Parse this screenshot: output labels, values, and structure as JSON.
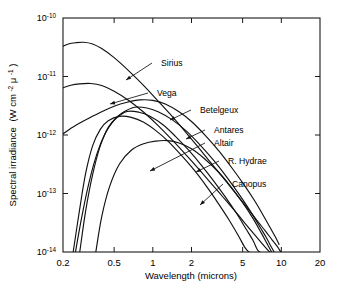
{
  "figure": {
    "background_color": "#ffffff",
    "line_color": "#111111"
  },
  "chart_data": {
    "type": "line",
    "title": "",
    "xlabel": "Wavelength (microns)",
    "ylabel": "Spectral irradiance (W cm⁻² μ⁻¹)",
    "ylabel_plain": "Spectral irradiance",
    "ylabel_units_parts": {
      "open": "(W cm",
      "exp1": "-2",
      "mu": " μ",
      "exp2": "-1",
      "close": ")"
    },
    "xscale": "log",
    "yscale": "log",
    "xlim": [
      0.2,
      20
    ],
    "ylim": [
      1e-14,
      1e-10
    ],
    "grid": false,
    "legend": "inline-annotations",
    "xticks": [
      0.2,
      0.5,
      1,
      2,
      5,
      10,
      20
    ],
    "xtick_labels": [
      "0.2",
      "0.5",
      "1",
      "2",
      "5",
      "10",
      "20"
    ],
    "yticks": [
      1e-14,
      1e-13,
      1e-12,
      1e-11,
      1e-10
    ],
    "ytick_labels_mantissa": [
      "10",
      "10",
      "10",
      "10",
      "10"
    ],
    "ytick_labels_exponent": [
      "-14",
      "-13",
      "-12",
      "-11",
      "-10"
    ],
    "series": [
      {
        "name": "Sirius",
        "peak_wavelength_microns": 0.29,
        "peak_irradiance": 3.8e-11,
        "points": [
          [
            0.2,
            3.3e-11
          ],
          [
            0.22,
            3.6e-11
          ],
          [
            0.25,
            3.78e-11
          ],
          [
            0.29,
            3.85e-11
          ],
          [
            0.34,
            3.6e-11
          ],
          [
            0.4,
            3e-11
          ],
          [
            0.5,
            2.1e-11
          ],
          [
            0.65,
            1.25e-11
          ],
          [
            0.85,
            7e-12
          ],
          [
            1.1,
            3.8e-12
          ],
          [
            1.5,
            1.8e-12
          ],
          [
            2.0,
            8.5e-13
          ],
          [
            2.7,
            3.8e-13
          ],
          [
            3.5,
            1.9e-13
          ],
          [
            4.5,
            9.5e-14
          ],
          [
            5.5,
            5.5e-14
          ],
          [
            6.5,
            3.4e-14
          ],
          [
            7.5,
            2.3e-14
          ],
          [
            8.5,
            1.6e-14
          ],
          [
            9.3,
            1.25e-14
          ],
          [
            9.9,
            1e-14
          ]
        ]
      },
      {
        "name": "Vega",
        "peak_wavelength_microns": 0.33,
        "peak_irradiance": 7.6e-12,
        "points": [
          [
            0.2,
            6.4e-12
          ],
          [
            0.23,
            7.1e-12
          ],
          [
            0.27,
            7.5e-12
          ],
          [
            0.33,
            7.6e-12
          ],
          [
            0.4,
            7e-12
          ],
          [
            0.5,
            5.6e-12
          ],
          [
            0.65,
            3.9e-12
          ],
          [
            0.85,
            2.45e-12
          ],
          [
            1.1,
            1.45e-12
          ],
          [
            1.5,
            7.2e-13
          ],
          [
            2.0,
            3.6e-13
          ],
          [
            2.7,
            1.7e-13
          ],
          [
            3.5,
            8.8e-14
          ],
          [
            4.5,
            4.6e-14
          ],
          [
            5.5,
            2.7e-14
          ],
          [
            6.5,
            1.75e-14
          ],
          [
            7.4,
            1.25e-14
          ],
          [
            8.1,
            1e-14
          ]
        ]
      },
      {
        "name": "Betelgeux",
        "peak_wavelength_microns": 0.8,
        "peak_irradiance": 4e-12,
        "points": [
          [
            0.2,
            1.05e-12
          ],
          [
            0.25,
            1.45e-12
          ],
          [
            0.32,
            1.95e-12
          ],
          [
            0.4,
            2.5e-12
          ],
          [
            0.5,
            3.1e-12
          ],
          [
            0.62,
            3.6e-12
          ],
          [
            0.8,
            3.98e-12
          ],
          [
            1.0,
            3.9e-12
          ],
          [
            1.25,
            3.4e-12
          ],
          [
            1.6,
            2.5e-12
          ],
          [
            2.0,
            1.7e-12
          ],
          [
            2.6,
            9.5e-13
          ],
          [
            3.3,
            5.2e-13
          ],
          [
            4.2,
            2.6e-13
          ],
          [
            5.2,
            1.35e-13
          ],
          [
            6.2,
            7.5e-14
          ],
          [
            7.2,
            4.3e-14
          ],
          [
            8.2,
            2.6e-14
          ],
          [
            9.0,
            1.8e-14
          ],
          [
            9.6,
            1.35e-14
          ]
        ]
      },
      {
        "name": "Antares",
        "peak_wavelength_microns": 0.72,
        "peak_irradiance": 3e-12,
        "points": [
          [
            0.25,
            1e-14
          ],
          [
            0.28,
            4e-14
          ],
          [
            0.32,
            1.6e-13
          ],
          [
            0.37,
            5e-13
          ],
          [
            0.43,
            1.1e-12
          ],
          [
            0.5,
            1.8e-12
          ],
          [
            0.58,
            2.4e-12
          ],
          [
            0.72,
            2.98e-12
          ],
          [
            0.9,
            2.9e-12
          ],
          [
            1.1,
            2.5e-12
          ],
          [
            1.4,
            1.85e-12
          ],
          [
            1.8,
            1.2e-12
          ],
          [
            2.3,
            7e-13
          ],
          [
            3.0,
            3.6e-13
          ],
          [
            3.8,
            1.85e-13
          ],
          [
            4.8,
            9e-14
          ],
          [
            5.8,
            4.8e-14
          ],
          [
            6.8,
            2.7e-14
          ],
          [
            7.6,
            1.8e-14
          ],
          [
            8.3,
            1.25e-14
          ],
          [
            8.8,
            1e-14
          ]
        ]
      },
      {
        "name": "Altair",
        "peak_wavelength_microns": 0.63,
        "peak_irradiance": 2.55e-12,
        "points": [
          [
            0.27,
            1e-14
          ],
          [
            0.3,
            5e-14
          ],
          [
            0.34,
            2.1e-13
          ],
          [
            0.39,
            6.5e-13
          ],
          [
            0.45,
            1.35e-12
          ],
          [
            0.52,
            1.95e-12
          ],
          [
            0.63,
            2.52e-12
          ],
          [
            0.78,
            2.45e-12
          ],
          [
            0.95,
            2.1e-12
          ],
          [
            1.2,
            1.5e-12
          ],
          [
            1.5,
            9.5e-13
          ],
          [
            1.9,
            5.5e-13
          ],
          [
            2.4,
            3e-13
          ],
          [
            3.0,
            1.6e-13
          ],
          [
            3.7,
            8.5e-14
          ],
          [
            4.5,
            4.5e-14
          ],
          [
            5.3,
            2.5e-14
          ],
          [
            6.0,
            1.6e-14
          ],
          [
            6.5,
            1.1e-14
          ],
          [
            6.8,
            1e-14
          ]
        ]
      },
      {
        "name": "R. Hydrae",
        "peak_wavelength_microns": 1.3,
        "peak_irradiance": 8e-13,
        "points": [
          [
            0.36,
            1e-14
          ],
          [
            0.4,
            4e-14
          ],
          [
            0.46,
            1.3e-13
          ],
          [
            0.55,
            3.2e-13
          ],
          [
            0.68,
            5.5e-13
          ],
          [
            0.85,
            7.1e-13
          ],
          [
            1.05,
            7.85e-13
          ],
          [
            1.3,
            8e-13
          ],
          [
            1.6,
            7.3e-13
          ],
          [
            2.0,
            5.8e-13
          ],
          [
            2.5,
            4e-13
          ],
          [
            3.2,
            2.4e-13
          ],
          [
            4.0,
            1.35e-13
          ],
          [
            5.0,
            7e-14
          ],
          [
            6.0,
            3.8e-14
          ],
          [
            7.0,
            2.1e-14
          ],
          [
            7.8,
            1.35e-14
          ],
          [
            8.4,
            1e-14
          ]
        ]
      },
      {
        "name": "Canopus",
        "peak_wavelength_microns": 0.55,
        "peak_irradiance": 2.1e-12,
        "points": [
          [
            0.24,
            1e-14
          ],
          [
            0.27,
            5.5e-14
          ],
          [
            0.3,
            2.2e-13
          ],
          [
            0.34,
            6.5e-13
          ],
          [
            0.39,
            1.25e-12
          ],
          [
            0.45,
            1.75e-12
          ],
          [
            0.55,
            2.08e-12
          ],
          [
            0.68,
            2e-12
          ],
          [
            0.85,
            1.65e-12
          ],
          [
            1.05,
            1.2e-12
          ],
          [
            1.3,
            8e-13
          ],
          [
            1.65,
            4.6e-13
          ],
          [
            2.1,
            2.5e-13
          ],
          [
            2.6,
            1.35e-13
          ],
          [
            3.2,
            7e-14
          ],
          [
            3.9,
            3.6e-14
          ],
          [
            4.6,
            1.95e-14
          ],
          [
            5.2,
            1.2e-14
          ],
          [
            5.6,
            1e-14
          ]
        ]
      }
    ],
    "annotations": [
      {
        "label": "Sirius",
        "text_x": 161,
        "text_y": 63,
        "tip_x": 126,
        "tip_y": 80
      },
      {
        "label": "Vega",
        "text_x": 157,
        "text_y": 93,
        "tip_x": 110,
        "tip_y": 104
      },
      {
        "label": "Betelgeux",
        "text_x": 200,
        "text_y": 110,
        "tip_x": 170,
        "tip_y": 120
      },
      {
        "label": "Antares",
        "text_x": 214,
        "text_y": 130,
        "tip_x": 186,
        "tip_y": 139
      },
      {
        "label": "Altair",
        "text_x": 214,
        "text_y": 143,
        "tip_x": 150,
        "tip_y": 171
      },
      {
        "label": "R. Hydrae",
        "text_x": 228,
        "text_y": 161,
        "tip_x": 196,
        "tip_y": 172
      },
      {
        "label": "Canopus",
        "text_x": 232,
        "text_y": 184,
        "tip_x": 200,
        "tip_y": 205
      }
    ]
  }
}
